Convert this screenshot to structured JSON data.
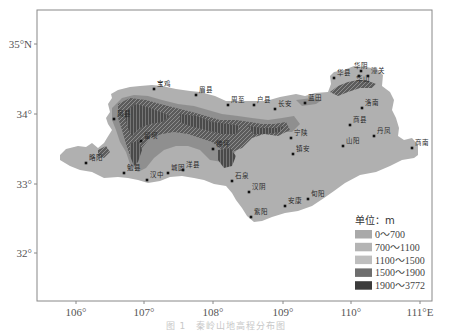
{
  "map": {
    "frame": {
      "x": 37,
      "y": 10,
      "width": 395,
      "height": 291
    },
    "x_ticks": [
      {
        "label": "106°",
        "x": 76
      },
      {
        "label": "107°",
        "x": 144
      },
      {
        "label": "108°",
        "x": 213
      },
      {
        "label": "109°",
        "x": 283
      },
      {
        "label": "110°",
        "x": 351
      },
      {
        "label": "111°E",
        "x": 420
      }
    ],
    "y_ticks": [
      {
        "label": "35°N",
        "y": 44
      },
      {
        "label": "34°",
        "y": 114
      },
      {
        "label": "33°",
        "y": 184
      },
      {
        "label": "32°",
        "y": 253
      }
    ],
    "legend": {
      "title": "单位：m",
      "classes": [
        {
          "label": "0～700",
          "color": "#a9a9a9"
        },
        {
          "label": "700～1100",
          "color": "#b4b4b4"
        },
        {
          "label": "1100～1500",
          "color": "#bebebe"
        },
        {
          "label": "1500～1900",
          "color": "#6e6e6e"
        },
        {
          "label": "1900～3772",
          "color": "#3c3c3c"
        }
      ]
    },
    "colors": {
      "base": "#b2b2b2",
      "mid": "#8a8a8a",
      "high": "#5a5a5a",
      "peak": "#333333",
      "frame": "#888888"
    },
    "stations": [
      {
        "name": "宝鸡",
        "x": 154,
        "y": 89,
        "lx": 157,
        "ly": 86
      },
      {
        "name": "眉县",
        "x": 196,
        "y": 95,
        "lx": 199,
        "ly": 92
      },
      {
        "name": "周至",
        "x": 228,
        "y": 105,
        "lx": 231,
        "ly": 102
      },
      {
        "name": "户县",
        "x": 254,
        "y": 105,
        "lx": 257,
        "ly": 102
      },
      {
        "name": "长安",
        "x": 275,
        "y": 109,
        "lx": 278,
        "ly": 106
      },
      {
        "name": "蓝田",
        "x": 305,
        "y": 103,
        "lx": 308,
        "ly": 100
      },
      {
        "name": "华县",
        "x": 334,
        "y": 78,
        "lx": 337,
        "ly": 75
      },
      {
        "name": "华阴",
        "x": 361,
        "y": 71,
        "lx": 354,
        "ly": 68
      },
      {
        "name": "华山",
        "x": 359,
        "y": 76,
        "lx": 356,
        "ly": 81
      },
      {
        "name": "潼关",
        "x": 368,
        "y": 76,
        "lx": 371,
        "ly": 73
      },
      {
        "name": "洛南",
        "x": 362,
        "y": 108,
        "lx": 365,
        "ly": 105
      },
      {
        "name": "商县",
        "x": 350,
        "y": 125,
        "lx": 353,
        "ly": 122
      },
      {
        "name": "丹凤",
        "x": 374,
        "y": 136,
        "lx": 377,
        "ly": 133
      },
      {
        "name": "山阳",
        "x": 343,
        "y": 146,
        "lx": 346,
        "ly": 143
      },
      {
        "name": "商南",
        "x": 412,
        "y": 148,
        "lx": 415,
        "ly": 145
      },
      {
        "name": "镇安",
        "x": 293,
        "y": 154,
        "lx": 296,
        "ly": 151
      },
      {
        "name": "宁陕",
        "x": 291,
        "y": 138,
        "lx": 294,
        "ly": 135
      },
      {
        "name": "凤县",
        "x": 114,
        "y": 119,
        "lx": 117,
        "ly": 116
      },
      {
        "name": "留坝",
        "x": 141,
        "y": 141,
        "lx": 144,
        "ly": 138
      },
      {
        "name": "佛坪",
        "x": 213,
        "y": 149,
        "lx": 216,
        "ly": 146
      },
      {
        "name": "略阳",
        "x": 86,
        "y": 163,
        "lx": 89,
        "ly": 160
      },
      {
        "name": "勉县",
        "x": 124,
        "y": 173,
        "lx": 127,
        "ly": 170
      },
      {
        "name": "汉中",
        "x": 147,
        "y": 180,
        "lx": 150,
        "ly": 177
      },
      {
        "name": "城固",
        "x": 168,
        "y": 173,
        "lx": 171,
        "ly": 170
      },
      {
        "name": "洋县",
        "x": 183,
        "y": 170,
        "lx": 186,
        "ly": 167
      },
      {
        "name": "石泉",
        "x": 232,
        "y": 181,
        "lx": 235,
        "ly": 178
      },
      {
        "name": "汉阴",
        "x": 249,
        "y": 192,
        "lx": 252,
        "ly": 189
      },
      {
        "name": "旬阳",
        "x": 308,
        "y": 199,
        "lx": 311,
        "ly": 196
      },
      {
        "name": "安康",
        "x": 285,
        "y": 206,
        "lx": 288,
        "ly": 203
      },
      {
        "name": "紫阳",
        "x": 251,
        "y": 217,
        "lx": 254,
        "ly": 214
      }
    ]
  },
  "caption": "图 1　秦岭山地高程分布图"
}
